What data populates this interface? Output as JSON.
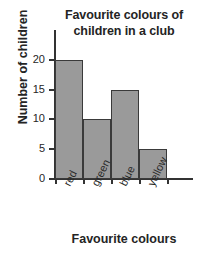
{
  "chart_data": {
    "type": "bar",
    "title": "Favourite colours of children in a club",
    "title_lines": [
      "Favourite colours of",
      "children in a club"
    ],
    "categories": [
      "red",
      "green",
      "blue",
      "yellow"
    ],
    "values": [
      20,
      10,
      15,
      5
    ],
    "xlabel": "Favourite colours",
    "ylabel": "Number of children",
    "yticks": [
      0,
      5,
      10,
      15,
      20
    ],
    "ytick_labels": [
      "0",
      "5",
      "10",
      "15",
      "20"
    ],
    "ylim": [
      0,
      25
    ],
    "grid": false,
    "legend": false,
    "bar_fill_color": "#9a9a9a",
    "bar_edge_color": "#3a3a3a",
    "axis_color": "#333333",
    "text_color": "#242424"
  }
}
